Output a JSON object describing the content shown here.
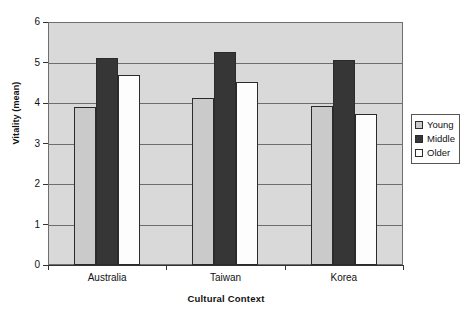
{
  "chart_data": {
    "type": "bar",
    "title": "",
    "subtitle": "",
    "xlabel": "Cultural Context",
    "ylabel": "Vitality (mean)",
    "categories": [
      "Australia",
      "Taiwan",
      "Korea"
    ],
    "series": [
      {
        "name": "Young",
        "values": [
          3.9,
          4.12,
          3.93
        ],
        "color": "#cacaca"
      },
      {
        "name": "Middle",
        "values": [
          5.1,
          5.25,
          5.07
        ],
        "color": "#363636"
      },
      {
        "name": "Older",
        "values": [
          4.7,
          4.52,
          3.72
        ],
        "color": "#fdfdfd"
      }
    ],
    "ylim": [
      0,
      6
    ],
    "yticks": [
      0,
      1,
      2,
      3,
      4,
      5,
      6
    ],
    "ytick_labels": [
      "0",
      "1",
      "2",
      "3",
      "4",
      "5",
      "6"
    ],
    "grid": true,
    "grid_axis": "y",
    "legend_position": "right",
    "plot_background": "#d9d9d9",
    "page_background": "#ffffff",
    "axis_color": "#6e6e6e",
    "bar_edge_color": "#2b2b2b"
  },
  "legend": {
    "entries": [
      {
        "label": "Young",
        "swatch": "#cacaca"
      },
      {
        "label": "Middle",
        "swatch": "#363636"
      },
      {
        "label": "Older",
        "swatch": "#fdfdfd"
      }
    ]
  }
}
